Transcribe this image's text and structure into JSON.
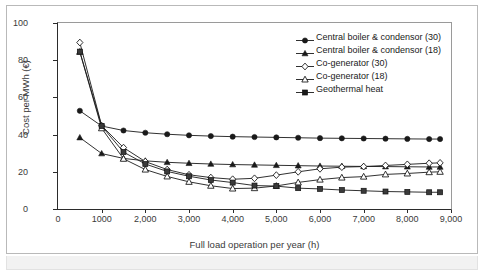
{
  "chart_data": {
    "type": "line",
    "title": "",
    "xlabel": "Full load operation per year (h)",
    "ylabel": "Cost per MWh (€)",
    "xlim": [
      0,
      9000
    ],
    "ylim": [
      0,
      100
    ],
    "xticks": [
      0,
      1000,
      2000,
      3000,
      4000,
      5000,
      6000,
      7000,
      8000,
      9000
    ],
    "xtick_labels": [
      "0",
      "1000",
      "2,000",
      "3,000",
      "4,000",
      "5,000",
      "6,000",
      "7,000",
      "8,000",
      "9,000"
    ],
    "yticks": [
      0,
      20,
      40,
      60,
      80,
      100
    ],
    "ytick_labels": [
      "0",
      "20",
      "40",
      "60",
      "80",
      "100"
    ],
    "grid": false,
    "legend_position": "upper right",
    "x": [
      500,
      1000,
      1500,
      2000,
      2500,
      3000,
      3500,
      4000,
      4500,
      5000,
      5500,
      6000,
      6500,
      7000,
      7500,
      8000,
      8500,
      8750
    ],
    "series": [
      {
        "name": "Central boiler & condensor (30)",
        "marker": "filled-circle",
        "color": "#1a1a1a",
        "values": [
          52.8,
          44.6,
          42.2,
          41.0,
          40.2,
          39.6,
          39.2,
          38.9,
          38.7,
          38.5,
          38.3,
          38.1,
          38.0,
          37.9,
          37.8,
          37.7,
          37.6,
          37.6
        ]
      },
      {
        "name": "Central boiler & condensor (18)",
        "marker": "filled-triangle",
        "color": "#1a1a1a",
        "values": [
          38.4,
          29.8,
          27.2,
          25.9,
          25.1,
          24.6,
          24.2,
          23.9,
          23.7,
          23.5,
          23.3,
          23.1,
          23.0,
          22.9,
          22.8,
          22.7,
          22.6,
          22.6
        ]
      },
      {
        "name": "Co-generator (30)",
        "marker": "open-diamond",
        "color": "#1a1a1a",
        "values": [
          89.5,
          44.8,
          33.0,
          25.5,
          21.2,
          18.4,
          16.9,
          16.0,
          16.5,
          18.2,
          20.0,
          21.6,
          22.5,
          22.8,
          23.4,
          24.0,
          24.6,
          24.8
        ]
      },
      {
        "name": "Co-generator (18)",
        "marker": "open-triangle",
        "color": "#1a1a1a",
        "values": [
          84.5,
          43.4,
          27.0,
          21.2,
          17.5,
          14.6,
          12.5,
          11.0,
          11.2,
          12.4,
          14.3,
          15.8,
          16.9,
          17.4,
          18.6,
          19.1,
          19.8,
          20.0
        ]
      },
      {
        "name": "Geothermal heat",
        "marker": "filled-square",
        "color": "#3a3a3a",
        "values": [
          84.6,
          44.6,
          30.6,
          24.2,
          20.2,
          17.6,
          15.6,
          14.2,
          12.6,
          12.3,
          11.2,
          10.8,
          10.2,
          9.8,
          9.4,
          9.2,
          9.0,
          9.0
        ]
      }
    ]
  },
  "legend": {
    "items": [
      {
        "label": "Central boiler & condensor (30)",
        "marker": "filled-circle"
      },
      {
        "label": "Central boiler & condensor (18)",
        "marker": "filled-triangle"
      },
      {
        "label": "Co-generator (30)",
        "marker": "open-diamond"
      },
      {
        "label": "Co-generator (18)",
        "marker": "open-triangle"
      },
      {
        "label": "Geothermal heat",
        "marker": "filled-square"
      }
    ]
  }
}
